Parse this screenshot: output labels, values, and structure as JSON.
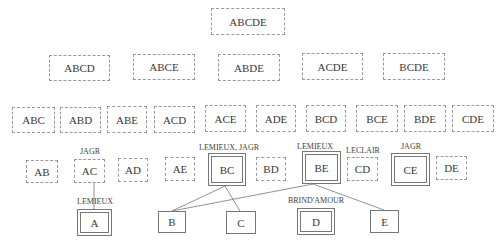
{
  "diagram": {
    "levels": [
      {
        "level": 5,
        "nodes": [
          {
            "id": "ABCDE",
            "label": "ABCDE",
            "style": "dashed",
            "x": 211,
            "y": 8,
            "w": 74,
            "h": 27
          }
        ]
      },
      {
        "level": 4,
        "nodes": [
          {
            "id": "ABCD",
            "label": "ABCD",
            "style": "dashed",
            "x": 49,
            "y": 55,
            "w": 61,
            "h": 26
          },
          {
            "id": "ABCE",
            "label": "ABCE",
            "style": "dashed",
            "x": 133,
            "y": 54,
            "w": 62,
            "h": 26
          },
          {
            "id": "ABDE",
            "label": "ABDE",
            "style": "dashed",
            "x": 218,
            "y": 54,
            "w": 62,
            "h": 27
          },
          {
            "id": "ACDE",
            "label": "ACDE",
            "style": "dashed",
            "x": 302,
            "y": 53,
            "w": 61,
            "h": 27
          },
          {
            "id": "BCDE",
            "label": "BCDE",
            "style": "dashed",
            "x": 383,
            "y": 53,
            "w": 62,
            "h": 27
          }
        ]
      },
      {
        "level": 3,
        "nodes": [
          {
            "id": "ABC",
            "label": "ABC",
            "style": "dashed",
            "x": 12,
            "y": 107,
            "w": 43,
            "h": 26
          },
          {
            "id": "ABD",
            "label": "ABD",
            "style": "dashed",
            "x": 60,
            "y": 107,
            "w": 41,
            "h": 26
          },
          {
            "id": "ABE",
            "label": "ABE",
            "style": "dashed",
            "x": 107,
            "y": 106,
            "w": 40,
            "h": 27
          },
          {
            "id": "ACD",
            "label": "ACD",
            "style": "dashed",
            "x": 154,
            "y": 106,
            "w": 41,
            "h": 27
          },
          {
            "id": "ACE",
            "label": "ACE",
            "style": "dashed",
            "x": 205,
            "y": 105,
            "w": 41,
            "h": 27
          },
          {
            "id": "ADE",
            "label": "ADE",
            "style": "dashed",
            "x": 256,
            "y": 105,
            "w": 40,
            "h": 27
          },
          {
            "id": "BCD",
            "label": "BCD",
            "style": "dashed",
            "x": 306,
            "y": 105,
            "w": 40,
            "h": 27
          },
          {
            "id": "BCE",
            "label": "BCE",
            "style": "dashed",
            "x": 356,
            "y": 105,
            "w": 42,
            "h": 27
          },
          {
            "id": "BDE",
            "label": "BDE",
            "style": "dashed",
            "x": 404,
            "y": 105,
            "w": 42,
            "h": 27
          },
          {
            "id": "CDE",
            "label": "CDE",
            "style": "dashed",
            "x": 452,
            "y": 105,
            "w": 42,
            "h": 27
          }
        ]
      },
      {
        "level": 2,
        "nodes": [
          {
            "id": "AB",
            "label": "AB",
            "style": "dashed",
            "x": 26,
            "y": 160,
            "w": 32,
            "h": 23
          },
          {
            "id": "AC",
            "label": "AC",
            "style": "dashed",
            "x": 74,
            "y": 159,
            "w": 31,
            "h": 24,
            "annotation": "JAGR"
          },
          {
            "id": "AD",
            "label": "AD",
            "style": "dashed",
            "x": 118,
            "y": 158,
            "w": 30,
            "h": 24
          },
          {
            "id": "AE",
            "label": "AE",
            "style": "dashed",
            "x": 165,
            "y": 157,
            "w": 30,
            "h": 24
          },
          {
            "id": "BC",
            "label": "BC",
            "style": "double",
            "x": 208,
            "y": 153,
            "w": 38,
            "h": 33,
            "annotation": "LEMIEUX, JAGR"
          },
          {
            "id": "BD",
            "label": "BD",
            "style": "dashed",
            "x": 256,
            "y": 157,
            "w": 30,
            "h": 24
          },
          {
            "id": "BE",
            "label": "BE",
            "style": "double",
            "x": 302,
            "y": 151,
            "w": 39,
            "h": 33,
            "annotation": "LEMIEUX"
          },
          {
            "id": "CD",
            "label": "CD",
            "style": "dashed",
            "x": 347,
            "y": 157,
            "w": 31,
            "h": 24,
            "annotation": "LECLAIR"
          },
          {
            "id": "CE",
            "label": "CE",
            "style": "double",
            "x": 391,
            "y": 153,
            "w": 39,
            "h": 33,
            "annotation": "JAGR"
          },
          {
            "id": "DE",
            "label": "DE",
            "style": "dashed",
            "x": 436,
            "y": 156,
            "w": 31,
            "h": 24
          }
        ]
      },
      {
        "level": 1,
        "nodes": [
          {
            "id": "A",
            "label": "A",
            "style": "double",
            "x": 77,
            "y": 209,
            "w": 35,
            "h": 27,
            "annotation": "LEMIEUX"
          },
          {
            "id": "B",
            "label": "B",
            "style": "solid",
            "x": 158,
            "y": 211,
            "w": 28,
            "h": 22
          },
          {
            "id": "C",
            "label": "C",
            "style": "solid",
            "x": 226,
            "y": 211,
            "w": 30,
            "h": 23
          },
          {
            "id": "D",
            "label": "D",
            "style": "double",
            "x": 297,
            "y": 208,
            "w": 38,
            "h": 27,
            "annotation": "BRIND'AMOUR"
          },
          {
            "id": "E",
            "label": "E",
            "style": "solid",
            "x": 370,
            "y": 210,
            "w": 29,
            "h": 23
          }
        ]
      }
    ],
    "annotations": [
      {
        "for": "AC",
        "text": "JAGR",
        "x": 90,
        "y": 147
      },
      {
        "for": "BC",
        "text": "LEMIEUX, JAGR",
        "x": 229,
        "y": 143
      },
      {
        "for": "BE",
        "text": "LEMIEUX",
        "x": 315,
        "y": 142
      },
      {
        "for": "CD",
        "text": "LECLAIR",
        "x": 363,
        "y": 146
      },
      {
        "for": "CE",
        "text": "JAGR",
        "x": 411,
        "y": 142
      },
      {
        "for": "A",
        "text": "LEMIEUX",
        "x": 95,
        "y": 197
      },
      {
        "for": "D",
        "text": "BRIND'AMOUR",
        "x": 316,
        "y": 196
      }
    ],
    "edges": [
      {
        "from": "AC",
        "to": "A",
        "x1": 94,
        "y1": 183,
        "x2": 94,
        "y2": 211
      },
      {
        "from": "BC",
        "to": "B",
        "x1": 225,
        "y1": 186,
        "x2": 172,
        "y2": 211
      },
      {
        "from": "BC",
        "to": "C",
        "x1": 225,
        "y1": 186,
        "x2": 240,
        "y2": 211
      },
      {
        "from": "BE",
        "to": "B",
        "x1": 313,
        "y1": 184,
        "x2": 172,
        "y2": 211
      },
      {
        "from": "BE",
        "to": "E",
        "x1": 313,
        "y1": 184,
        "x2": 384,
        "y2": 210
      }
    ]
  }
}
